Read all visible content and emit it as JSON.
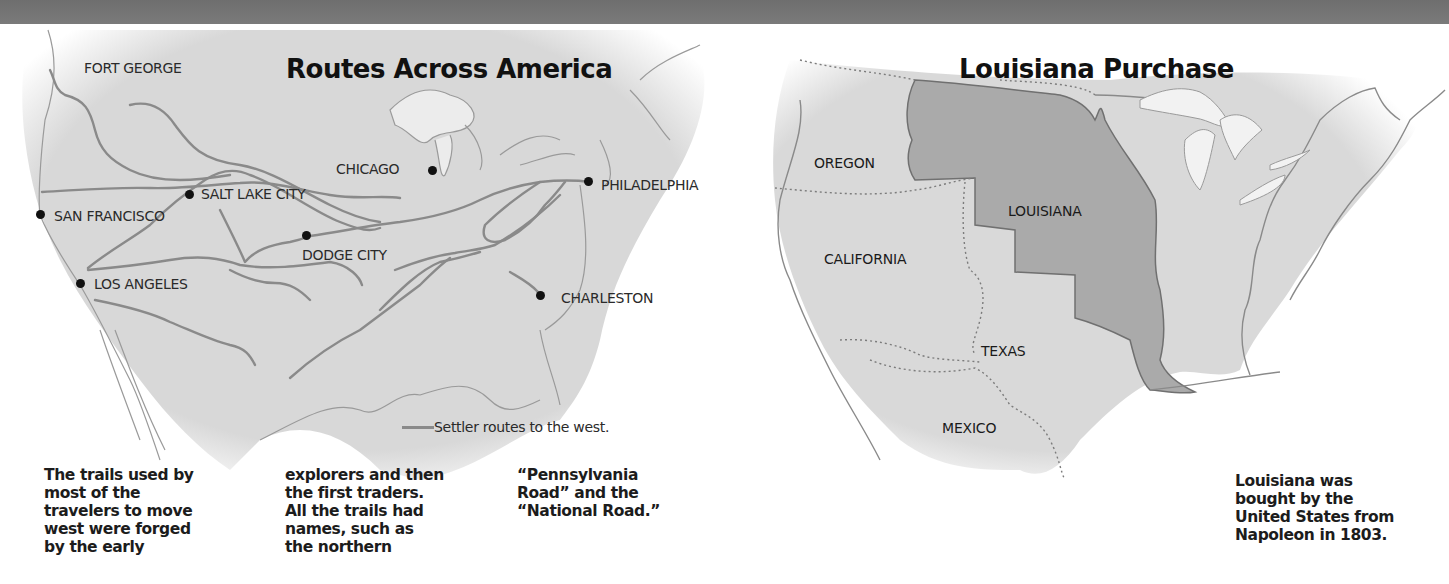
{
  "colors": {
    "top_bar": "#737373",
    "land": "#d9d9d9",
    "route": "#8a8a8a",
    "louisiana_fill": "#a9a9a9",
    "border": "#6a6a6a",
    "text": "#1a1a1a",
    "background": "#ffffff"
  },
  "left_map": {
    "title": "Routes Across America",
    "places": [
      {
        "name": "FORT GEORGE",
        "dot": false
      },
      {
        "name": "CHICAGO",
        "dot": true
      },
      {
        "name": "SALT LAKE CITY",
        "dot": true
      },
      {
        "name": "PHILADELPHIA",
        "dot": true
      },
      {
        "name": "SAN FRANCISCO",
        "dot": true
      },
      {
        "name": "DODGE CITY",
        "dot": true
      },
      {
        "name": "LOS ANGELES",
        "dot": true
      },
      {
        "name": "CHARLESTON",
        "dot": true
      }
    ],
    "legend": {
      "icon": "gray-line",
      "label": "Settler routes to the west."
    },
    "captions": [
      [
        "The trails used by",
        "most of the",
        "travelers to move",
        "west were forged",
        "by the early"
      ],
      [
        "explorers and then",
        "the first traders.",
        "All the trails had",
        "names, such as",
        "the northern"
      ],
      [
        "“Pennsylvania",
        "Road” and the",
        "“National Road.”"
      ]
    ]
  },
  "right_map": {
    "title": "Louisiana Purchase",
    "regions": [
      "OREGON",
      "LOUISIANA",
      "CALIFORNIA",
      "TEXAS",
      "MEXICO"
    ],
    "caption": [
      "Louisiana was",
      "bought by the",
      "United States from",
      "Napoleon in 1803."
    ]
  }
}
